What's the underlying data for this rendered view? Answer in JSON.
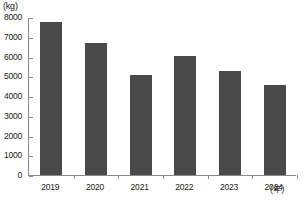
{
  "chart_data": {
    "type": "bar",
    "title": "",
    "subtitle": "",
    "xlabel": "(年)",
    "ylabel": "(kg)",
    "categories": [
      "2019",
      "2020",
      "2021",
      "2022",
      "2023",
      "2024"
    ],
    "values": [
      7750,
      6680,
      5050,
      6050,
      5250,
      4550
    ],
    "series": [
      {
        "name": "",
        "values": [
          7750,
          6680,
          5050,
          6050,
          5250,
          4550
        ]
      }
    ],
    "ylim": [
      0,
      8000
    ],
    "yticks": [
      0,
      1000,
      2000,
      3000,
      4000,
      5000,
      6000,
      7000,
      8000
    ],
    "ytick_labels": [
      "0",
      "1000",
      "2000",
      "3000",
      "4000",
      "5000",
      "6000",
      "7000",
      "8000"
    ],
    "grid": false,
    "legend": null,
    "legend_position": "none",
    "bar_color": "#4a4a4a",
    "axis_color": "#8a8a8a",
    "text_color": "#1a1a1a",
    "background": "#ffffff"
  }
}
